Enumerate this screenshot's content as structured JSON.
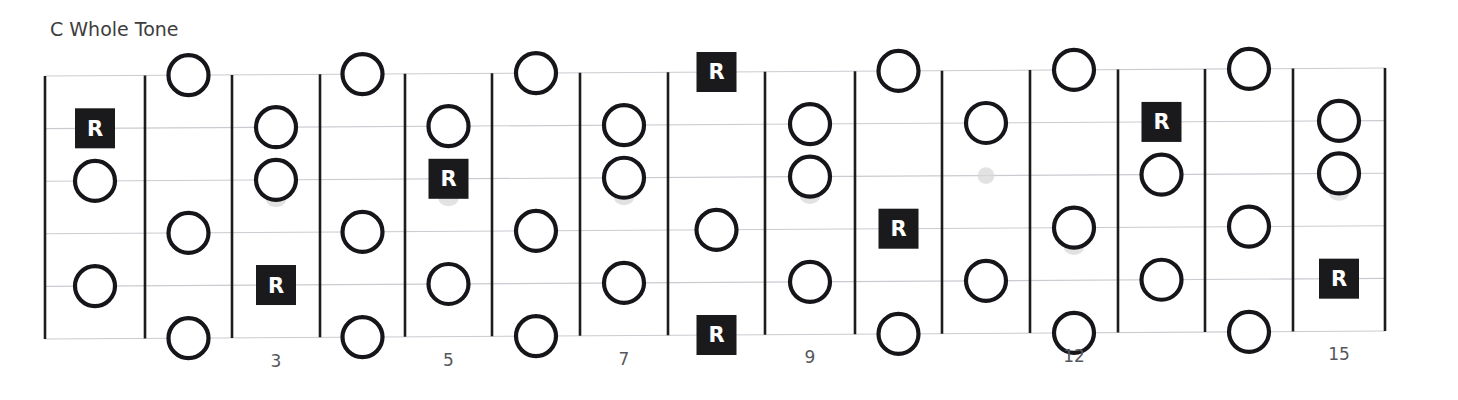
{
  "title": "C Whole Tone",
  "colors": {
    "ink": "#1a1a1c",
    "note_stroke": "#16161a",
    "note_fill": "#ffffff",
    "string": "#c9cbd0",
    "fret": "#1c1c1c",
    "label": "#55575c",
    "title": "#3d3d3d",
    "shadow": "#d8d8d8"
  },
  "root_glyph": "R",
  "fretboard": {
    "string_count": 6,
    "fret_count": 15,
    "first_fret": 1,
    "last_fret": 15,
    "geometry": {
      "x_left": 45,
      "x_right": 1385,
      "y_top": 72,
      "y_bottom": 335,
      "string_spacing": 52.6,
      "fret_spacing": 89.3,
      "note_radius": 20,
      "root_box_size": 40
    },
    "fret_wires_x": [
      45,
      145,
      232,
      320,
      405,
      492,
      580,
      668,
      765,
      855,
      942,
      1030,
      1118,
      1205,
      1293,
      1385
    ],
    "strings_y": [
      72,
      124.6,
      177.2,
      229.8,
      282.4,
      335
    ],
    "fret_markers": [
      {
        "fret": 3,
        "label": "3"
      },
      {
        "fret": 5,
        "label": "5"
      },
      {
        "fret": 7,
        "label": "7"
      },
      {
        "fret": 9,
        "label": "9"
      },
      {
        "fret": 12,
        "label": "12"
      },
      {
        "fret": 15,
        "label": "15"
      }
    ]
  },
  "chart_data": {
    "type": "table",
    "title": "C Whole Tone",
    "xlabel": "Fret",
    "ylabel": "String",
    "string_names": [
      "1",
      "2",
      "3",
      "4",
      "5",
      "6"
    ],
    "notes": [
      {
        "string": 1,
        "fret": 2,
        "type": "tone"
      },
      {
        "string": 1,
        "fret": 4,
        "type": "tone"
      },
      {
        "string": 1,
        "fret": 6,
        "type": "tone"
      },
      {
        "string": 1,
        "fret": 8,
        "type": "root"
      },
      {
        "string": 1,
        "fret": 10,
        "type": "tone"
      },
      {
        "string": 1,
        "fret": 12,
        "type": "tone"
      },
      {
        "string": 1,
        "fret": 14,
        "type": "tone"
      },
      {
        "string": 2,
        "fret": 1,
        "type": "root"
      },
      {
        "string": 2,
        "fret": 3,
        "type": "tone"
      },
      {
        "string": 2,
        "fret": 5,
        "type": "tone"
      },
      {
        "string": 2,
        "fret": 7,
        "type": "tone"
      },
      {
        "string": 2,
        "fret": 9,
        "type": "tone"
      },
      {
        "string": 2,
        "fret": 11,
        "type": "tone"
      },
      {
        "string": 2,
        "fret": 13,
        "type": "root"
      },
      {
        "string": 2,
        "fret": 15,
        "type": "tone"
      },
      {
        "string": 3,
        "fret": 1,
        "type": "tone"
      },
      {
        "string": 3,
        "fret": 3,
        "type": "tone",
        "shadow": true
      },
      {
        "string": 3,
        "fret": 5,
        "type": "root",
        "shadow": true
      },
      {
        "string": 3,
        "fret": 7,
        "type": "tone",
        "shadow": true
      },
      {
        "string": 3,
        "fret": 9,
        "type": "tone",
        "shadow": true
      },
      {
        "string": 3,
        "fret": 11,
        "type": "dot-faint"
      },
      {
        "string": 3,
        "fret": 13,
        "type": "tone"
      },
      {
        "string": 3,
        "fret": 15,
        "type": "tone",
        "shadow": true
      },
      {
        "string": 4,
        "fret": 2,
        "type": "tone"
      },
      {
        "string": 4,
        "fret": 4,
        "type": "tone"
      },
      {
        "string": 4,
        "fret": 6,
        "type": "tone"
      },
      {
        "string": 4,
        "fret": 8,
        "type": "tone"
      },
      {
        "string": 4,
        "fret": 10,
        "type": "root"
      },
      {
        "string": 4,
        "fret": 12,
        "type": "tone",
        "shadow": true
      },
      {
        "string": 4,
        "fret": 14,
        "type": "tone"
      },
      {
        "string": 5,
        "fret": 1,
        "type": "tone"
      },
      {
        "string": 5,
        "fret": 3,
        "type": "root"
      },
      {
        "string": 5,
        "fret": 5,
        "type": "tone"
      },
      {
        "string": 5,
        "fret": 7,
        "type": "tone"
      },
      {
        "string": 5,
        "fret": 9,
        "type": "tone"
      },
      {
        "string": 5,
        "fret": 11,
        "type": "tone"
      },
      {
        "string": 5,
        "fret": 13,
        "type": "tone"
      },
      {
        "string": 5,
        "fret": 15,
        "type": "root"
      },
      {
        "string": 6,
        "fret": 2,
        "type": "tone"
      },
      {
        "string": 6,
        "fret": 4,
        "type": "tone"
      },
      {
        "string": 6,
        "fret": 6,
        "type": "tone"
      },
      {
        "string": 6,
        "fret": 8,
        "type": "root"
      },
      {
        "string": 6,
        "fret": 10,
        "type": "tone"
      },
      {
        "string": 6,
        "fret": 12,
        "type": "tone"
      },
      {
        "string": 6,
        "fret": 14,
        "type": "tone"
      }
    ]
  }
}
